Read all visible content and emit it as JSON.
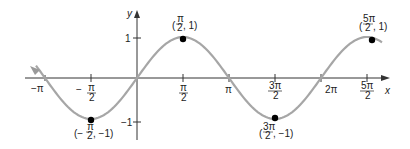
{
  "chart_data": {
    "type": "line",
    "title": "",
    "function": "y = sin(x)",
    "xlabel": "x",
    "ylabel": "y",
    "x_ticks": [
      "-π",
      "-π/2",
      "π/2",
      "π",
      "3π/2",
      "2π",
      "5π/2"
    ],
    "y_ticks": [
      "1",
      "-1"
    ],
    "xlim": [
      -3.6,
      8.3
    ],
    "ylim": [
      -1.3,
      1.4
    ],
    "grid": false,
    "color": "#a0a0a0",
    "points": [
      {
        "label": "(-π/2, -1)",
        "x": -1.5708,
        "y": -1
      },
      {
        "label": "(π/2, 1)",
        "x": 1.5708,
        "y": 1
      },
      {
        "label": "(3π/2, -1)",
        "x": 4.7124,
        "y": -1
      },
      {
        "label": "(5π/2, 1)",
        "x": 7.854,
        "y": 1
      }
    ]
  },
  "labels": {
    "x_axis": "x",
    "y_axis": "y",
    "y_one": "1",
    "y_neg_one": "−1",
    "neg_pi": "−π",
    "pi": "π",
    "two_pi": "2π",
    "pi_sym": "π",
    "three_pi": "3π",
    "five_pi": "5π",
    "two": "2",
    "minus": "−",
    "p1_y": ", 1)",
    "pm1_y": ", −1)",
    "open": "(",
    "open_neg": "(−"
  }
}
